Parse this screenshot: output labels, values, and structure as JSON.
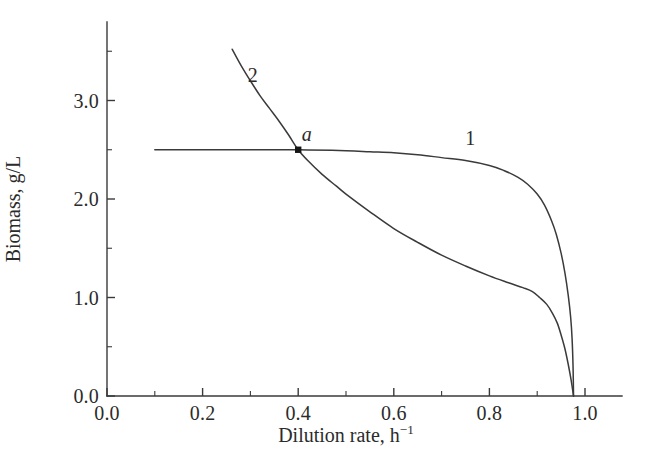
{
  "chart_data": {
    "type": "line",
    "title": "",
    "xlabel": "Dilution rate, h",
    "xlabel_exponent": "−1",
    "ylabel": "Biomass, g/L",
    "xlim": [
      0.0,
      1.08
    ],
    "ylim": [
      0.0,
      3.8
    ],
    "grid": false,
    "legend_position": "inline-curve-labels",
    "x_ticks_major": [
      "0.0",
      "0.2",
      "0.4",
      "0.6",
      "0.8",
      "1.0"
    ],
    "x_ticks_major_values": [
      0.0,
      0.2,
      0.4,
      0.6,
      0.8,
      1.0
    ],
    "x_ticks_minor_values": [
      0.1,
      0.3,
      0.5,
      0.7,
      0.9
    ],
    "y_ticks_major": [
      "0.0",
      "1.0",
      "2.0",
      "3.0"
    ],
    "y_ticks_major_values": [
      0.0,
      1.0,
      2.0,
      3.0
    ],
    "y_ticks_minor_values": [
      0.5,
      1.5,
      2.5,
      3.5
    ],
    "series": [
      {
        "name": "1",
        "label": "1",
        "label_at": [
          0.76,
          2.62
        ],
        "points": [
          [
            0.1,
            2.5
          ],
          [
            0.2,
            2.5
          ],
          [
            0.3,
            2.5
          ],
          [
            0.4,
            2.5
          ],
          [
            0.5,
            2.49
          ],
          [
            0.55,
            2.48
          ],
          [
            0.6,
            2.47
          ],
          [
            0.65,
            2.45
          ],
          [
            0.7,
            2.42
          ],
          [
            0.75,
            2.39
          ],
          [
            0.8,
            2.34
          ],
          [
            0.83,
            2.29
          ],
          [
            0.86,
            2.22
          ],
          [
            0.88,
            2.15
          ],
          [
            0.9,
            2.05
          ],
          [
            0.915,
            1.94
          ],
          [
            0.93,
            1.78
          ],
          [
            0.94,
            1.64
          ],
          [
            0.95,
            1.45
          ],
          [
            0.958,
            1.25
          ],
          [
            0.965,
            1.02
          ],
          [
            0.97,
            0.8
          ],
          [
            0.973,
            0.58
          ],
          [
            0.975,
            0.3
          ],
          [
            0.976,
            0.0
          ]
        ]
      },
      {
        "name": "2",
        "label": "2",
        "label_at": [
          0.305,
          3.26
        ],
        "points": [
          [
            0.262,
            3.52
          ],
          [
            0.28,
            3.36
          ],
          [
            0.3,
            3.2
          ],
          [
            0.32,
            3.05
          ],
          [
            0.34,
            2.92
          ],
          [
            0.36,
            2.79
          ],
          [
            0.38,
            2.65
          ],
          [
            0.4,
            2.5
          ],
          [
            0.42,
            2.39
          ],
          [
            0.45,
            2.25
          ],
          [
            0.48,
            2.13
          ],
          [
            0.5,
            2.05
          ],
          [
            0.55,
            1.87
          ],
          [
            0.6,
            1.7
          ],
          [
            0.65,
            1.56
          ],
          [
            0.7,
            1.43
          ],
          [
            0.75,
            1.32
          ],
          [
            0.8,
            1.22
          ],
          [
            0.84,
            1.15
          ],
          [
            0.87,
            1.1
          ],
          [
            0.89,
            1.06
          ],
          [
            0.905,
            1.0
          ],
          [
            0.92,
            0.93
          ],
          [
            0.932,
            0.84
          ],
          [
            0.942,
            0.74
          ],
          [
            0.95,
            0.62
          ],
          [
            0.958,
            0.48
          ],
          [
            0.965,
            0.32
          ],
          [
            0.971,
            0.16
          ],
          [
            0.976,
            0.0
          ]
        ]
      }
    ],
    "annotations": [
      {
        "label": "a",
        "kind": "intersection-point",
        "x": 0.4,
        "y": 2.5,
        "label_at": [
          0.418,
          2.66
        ],
        "marker": "filled-square"
      }
    ]
  },
  "geometry": {
    "origin_px": [
      107,
      396
    ],
    "x_unit_px": 478,
    "y_unit_px": 98.5,
    "x_axis_right_px": 622,
    "y_axis_top_px": 22
  },
  "colors": {
    "axis": "#3a3a3a",
    "curve": "#3a3a3a",
    "text": "#2b2b2b",
    "marker": "#151515",
    "background": "#ffffff"
  }
}
